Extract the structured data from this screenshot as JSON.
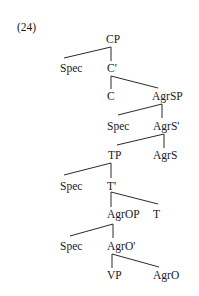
{
  "example_number": "(24)",
  "tree": {
    "nodes": [
      {
        "id": "cp",
        "label": "CP",
        "x": 106,
        "y": 33
      },
      {
        "id": "spec1",
        "label": "Spec",
        "x": 60,
        "y": 62
      },
      {
        "id": "cbar",
        "label": "C'",
        "x": 107,
        "y": 62
      },
      {
        "id": "c",
        "label": "C",
        "x": 107,
        "y": 90
      },
      {
        "id": "agrsp",
        "label": "AgrSP",
        "x": 152,
        "y": 90
      },
      {
        "id": "spec2",
        "label": "Spec",
        "x": 107,
        "y": 120
      },
      {
        "id": "agrsbar",
        "label": "AgrS'",
        "x": 153,
        "y": 120
      },
      {
        "id": "tp",
        "label": "TP",
        "x": 108,
        "y": 149
      },
      {
        "id": "agrs",
        "label": "AgrS",
        "x": 153,
        "y": 149
      },
      {
        "id": "spec3",
        "label": "Spec",
        "x": 60,
        "y": 180
      },
      {
        "id": "tbar",
        "label": "T'",
        "x": 107,
        "y": 180
      },
      {
        "id": "agrop",
        "label": "AgrOP",
        "x": 107,
        "y": 208
      },
      {
        "id": "t",
        "label": "T",
        "x": 153,
        "y": 208
      },
      {
        "id": "spec4",
        "label": "Spec",
        "x": 60,
        "y": 240
      },
      {
        "id": "agrobar",
        "label": "AgrO'",
        "x": 107,
        "y": 240
      },
      {
        "id": "vp",
        "label": "VP",
        "x": 107,
        "y": 269
      },
      {
        "id": "agro",
        "label": "AgrO",
        "x": 153,
        "y": 269
      }
    ],
    "edges": [
      {
        "from": "cp",
        "to": "spec1",
        "x1": 111,
        "y1": 47,
        "x2": 64,
        "y2": 58
      },
      {
        "from": "cp",
        "to": "cbar",
        "x1": 111,
        "y1": 47,
        "x2": 111,
        "y2": 61
      },
      {
        "from": "cbar",
        "to": "c",
        "x1": 111,
        "y1": 76,
        "x2": 111,
        "y2": 89
      },
      {
        "from": "cbar",
        "to": "agrsp",
        "x1": 111,
        "y1": 76,
        "x2": 158,
        "y2": 88
      },
      {
        "from": "agrsp",
        "to": "spec2",
        "x1": 162,
        "y1": 104,
        "x2": 118,
        "y2": 115
      },
      {
        "from": "agrsp",
        "to": "agrsbar",
        "x1": 162,
        "y1": 104,
        "x2": 162,
        "y2": 118
      },
      {
        "from": "agrsbar",
        "to": "tp",
        "x1": 164,
        "y1": 134,
        "x2": 117,
        "y2": 145
      },
      {
        "from": "agrsbar",
        "to": "agrs",
        "x1": 164,
        "y1": 134,
        "x2": 164,
        "y2": 148
      },
      {
        "from": "tp",
        "to": "spec3",
        "x1": 111,
        "y1": 163,
        "x2": 64,
        "y2": 175
      },
      {
        "from": "tp",
        "to": "tbar",
        "x1": 111,
        "y1": 163,
        "x2": 111,
        "y2": 178
      },
      {
        "from": "tbar",
        "to": "agrop",
        "x1": 111,
        "y1": 192,
        "x2": 111,
        "y2": 207
      },
      {
        "from": "tbar",
        "to": "t",
        "x1": 111,
        "y1": 192,
        "x2": 158,
        "y2": 204
      },
      {
        "from": "agrop",
        "to": "spec4",
        "x1": 113,
        "y1": 224,
        "x2": 70,
        "y2": 236
      },
      {
        "from": "agrop",
        "to": "agrobar",
        "x1": 113,
        "y1": 224,
        "x2": 113,
        "y2": 238
      },
      {
        "from": "agrobar",
        "to": "vp",
        "x1": 112,
        "y1": 254,
        "x2": 112,
        "y2": 268
      },
      {
        "from": "agrobar",
        "to": "agro",
        "x1": 112,
        "y1": 254,
        "x2": 159,
        "y2": 267
      }
    ]
  },
  "colors": {
    "text": "#1a1a1a",
    "line": "#2a2a2a",
    "background": "#ffffff"
  }
}
